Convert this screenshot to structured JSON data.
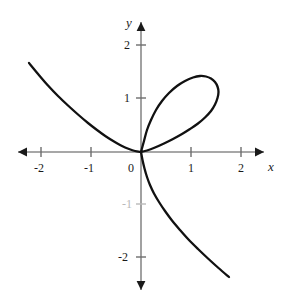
{
  "chart_data": {
    "type": "line",
    "title": "",
    "subtitle": "",
    "curve_name": "Folium of Descartes",
    "equation": "x^3 + y^3 = 3axy",
    "xlabel": "x",
    "ylabel": "y",
    "xlim": [
      -2.45,
      2.45
    ],
    "ylim": [
      -2.55,
      2.55
    ],
    "grid": false,
    "legend": null,
    "annotations": [],
    "x_ticks": [
      {
        "value": -2,
        "label": "-2"
      },
      {
        "value": -1,
        "label": "-1"
      },
      {
        "value": 0,
        "label": "0"
      },
      {
        "value": 1,
        "label": "1"
      },
      {
        "value": 2,
        "label": "2"
      }
    ],
    "y_ticks": [
      {
        "value": 2,
        "label": "2"
      },
      {
        "value": 1,
        "label": "1"
      },
      {
        "value": -1,
        "label": "-1"
      },
      {
        "value": -2,
        "label": "-2"
      }
    ],
    "origin_label": "0",
    "axis_color": "#8a8a8a",
    "curve_color": "#111111",
    "background_color": "#ffffff",
    "series": [
      {
        "name": "loop-branch",
        "comment": "first-quadrant loop of the folium, from origin up-right around and back to origin",
        "points": [
          [
            0.0,
            0.0
          ],
          [
            0.06,
            0.22
          ],
          [
            0.12,
            0.44
          ],
          [
            0.2,
            0.64
          ],
          [
            0.3,
            0.84
          ],
          [
            0.42,
            1.02
          ],
          [
            0.56,
            1.18
          ],
          [
            0.72,
            1.32
          ],
          [
            0.88,
            1.42
          ],
          [
            1.04,
            1.49
          ],
          [
            1.18,
            1.52
          ],
          [
            1.3,
            1.51
          ],
          [
            1.4,
            1.47
          ],
          [
            1.48,
            1.4
          ],
          [
            1.53,
            1.31
          ],
          [
            1.55,
            1.2
          ],
          [
            1.53,
            1.08
          ],
          [
            1.48,
            0.95
          ],
          [
            1.4,
            0.82
          ],
          [
            1.28,
            0.69
          ],
          [
            1.14,
            0.57
          ],
          [
            0.98,
            0.46
          ],
          [
            0.82,
            0.36
          ],
          [
            0.64,
            0.26
          ],
          [
            0.46,
            0.17
          ],
          [
            0.28,
            0.09
          ],
          [
            0.12,
            0.03
          ],
          [
            0.0,
            0.0
          ]
        ]
      },
      {
        "name": "upper-left-branch",
        "comment": "branch in the second quadrant descending from upper left to the origin",
        "points": [
          [
            -2.24,
            1.78
          ],
          [
            -2.05,
            1.55
          ],
          [
            -1.86,
            1.33
          ],
          [
            -1.66,
            1.12
          ],
          [
            -1.46,
            0.93
          ],
          [
            -1.26,
            0.75
          ],
          [
            -1.06,
            0.58
          ],
          [
            -0.88,
            0.44
          ],
          [
            -0.7,
            0.31
          ],
          [
            -0.54,
            0.21
          ],
          [
            -0.38,
            0.12
          ],
          [
            -0.24,
            0.06
          ],
          [
            -0.12,
            0.02
          ],
          [
            0.0,
            0.0
          ]
        ]
      },
      {
        "name": "lower-right-branch",
        "comment": "branch in the fourth quadrant descending steeply from origin to lower right",
        "points": [
          [
            0.0,
            0.0
          ],
          [
            0.03,
            -0.16
          ],
          [
            0.07,
            -0.33
          ],
          [
            0.12,
            -0.5
          ],
          [
            0.18,
            -0.66
          ],
          [
            0.26,
            -0.83
          ],
          [
            0.36,
            -1.0
          ],
          [
            0.48,
            -1.18
          ],
          [
            0.62,
            -1.37
          ],
          [
            0.78,
            -1.56
          ],
          [
            0.95,
            -1.75
          ],
          [
            1.14,
            -1.94
          ],
          [
            1.34,
            -2.13
          ],
          [
            1.55,
            -2.32
          ],
          [
            1.76,
            -2.5
          ]
        ]
      }
    ]
  },
  "axis_labels": {
    "x": "x",
    "y": "y"
  }
}
